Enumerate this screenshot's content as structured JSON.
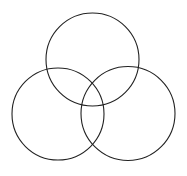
{
  "diagram": {
    "type": "venn",
    "set_count": 3,
    "background": "#ffffff",
    "stroke_color": "#222222",
    "stroke_width": 1.1,
    "circles": [
      {
        "name": "top",
        "cx": 92.5,
        "cy": 59.5,
        "r": 46.5
      },
      {
        "name": "left",
        "cx": 58,
        "cy": 114,
        "r": 46
      },
      {
        "name": "right",
        "cx": 128,
        "cy": 113.5,
        "r": 47
      }
    ],
    "labels": []
  }
}
